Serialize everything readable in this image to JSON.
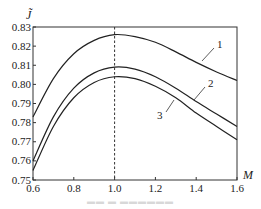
{
  "chart_data": {
    "type": "line",
    "title": "",
    "xlabel": "M",
    "ylabel": "J̃",
    "xlim": [
      0.6,
      1.6
    ],
    "ylim": [
      0.75,
      0.83
    ],
    "grid": false,
    "legend": "inline numeric labels on curves",
    "x_ticks": [
      "0.6",
      "0.8",
      "1.0",
      "1.2",
      "1.4",
      "1.6"
    ],
    "y_ticks": [
      "0.75",
      "0.76",
      "0.77",
      "0.78",
      "0.79",
      "0.80",
      "0.81",
      "0.82",
      "0.83"
    ],
    "x": [
      0.6,
      0.7,
      0.8,
      0.9,
      1.0,
      1.1,
      1.2,
      1.3,
      1.4,
      1.5,
      1.6
    ],
    "series": [
      {
        "name": "1",
        "values": [
          0.783,
          0.803,
          0.816,
          0.823,
          0.826,
          0.825,
          0.822,
          0.817,
          0.8115,
          0.8065,
          0.802
        ]
      },
      {
        "name": "2",
        "values": [
          0.76,
          0.783,
          0.798,
          0.806,
          0.809,
          0.808,
          0.804,
          0.798,
          0.791,
          0.7845,
          0.778
        ]
      },
      {
        "name": "3",
        "values": [
          0.755,
          0.778,
          0.793,
          0.801,
          0.804,
          0.803,
          0.799,
          0.793,
          0.785,
          0.778,
          0.771
        ]
      }
    ],
    "annotations": [
      {
        "type": "vertical-dashed-line",
        "x": 1.0
      }
    ]
  },
  "axes": {
    "y_title": "J̃",
    "x_title": "M"
  },
  "curve_labels": [
    "1",
    "2",
    "3"
  ]
}
